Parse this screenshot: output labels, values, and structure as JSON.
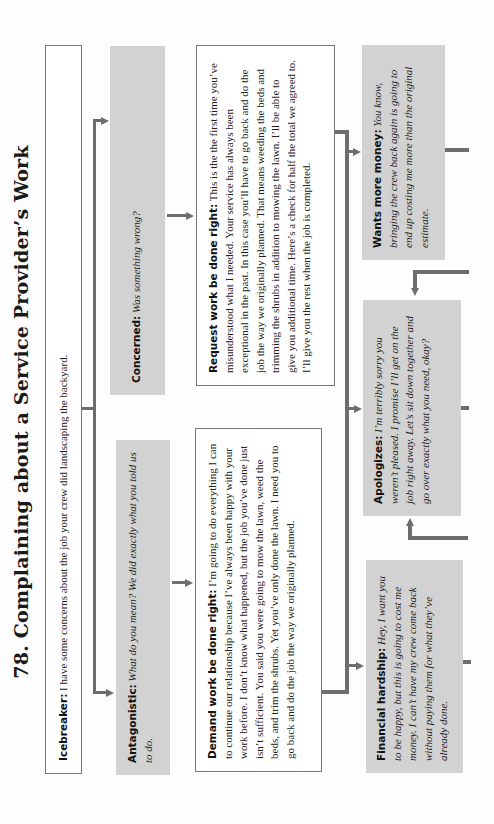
{
  "title": "78. Complaining about a Service Provider’s Work",
  "icebreaker": {
    "label": "Icebreaker:",
    "text": " I have some concerns about the job your crew did landscaping the backyard."
  },
  "antagonistic": {
    "label": "Antagonistic:",
    "text": " What do you mean? We did exactly what you told us to do."
  },
  "concerned": {
    "label": "Concerned:",
    "text": " Was something wrong?"
  },
  "demand": {
    "label": "Demand work be done right:",
    "text": " I’m going to do everything I can to continue our relationship because I’ve always been happy with your work before. I don’t know what happened, but the job you’ve done just isn’t sufficient. You said you were going to mow the lawn, weed the beds, and trim the shrubs. Yet you’ve only done the lawn. I need you to go back and do the job the way we originally planned."
  },
  "request": {
    "label": "Request work be done right:",
    "text": " This is the the first time you’ve misunderstood what I needed. Your service has always been exceptional in the past. In this case you’ll have to go back and do the job the way we originally planned. That means weeding the beds and trimming the shrubs in addition to mowing the lawn. I’ll be able to give you additional time. Here’s a check for half the total we agreed to. I’ll give you the rest when the job is completed."
  },
  "financial": {
    "label": "Financial hardship:",
    "text": " Hey, I want you to be happy, but this is going to cost me money. I can’t have my crew come back without paying them for what they’ve already done."
  },
  "apologizes": {
    "label": "Apologizes:",
    "text": " I’m terribly sorry you weren’t pleased. I promise I’ll get on the job right away. Let’s sit down together and go over exactly what you need, okay?"
  },
  "wants_money": {
    "label": "Wants more money:",
    "text": " You know, bringing the crew back again is going to end up costing me more than the original estimate."
  },
  "colors": {
    "grey_box": "#d2d2d2",
    "connector": "#6e6e6e",
    "outline": "#777777"
  }
}
